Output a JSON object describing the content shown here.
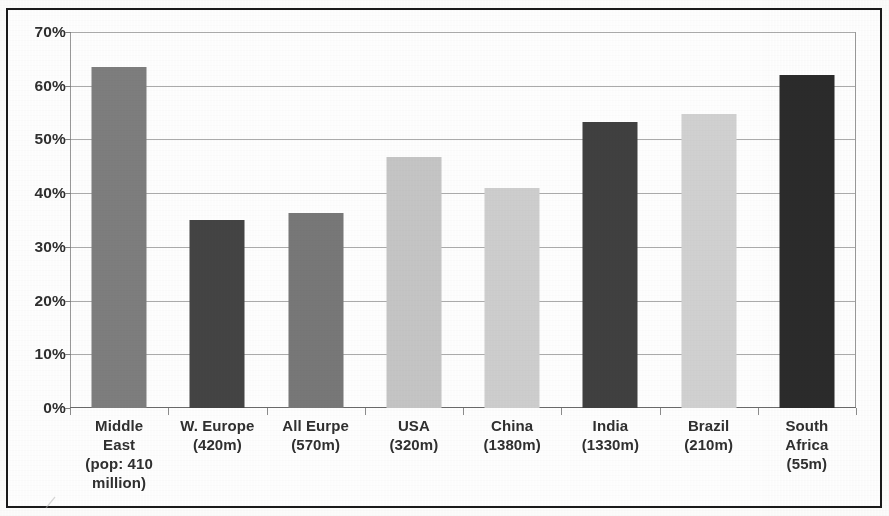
{
  "figure": {
    "frame_color": "#1a1a1a",
    "background": "#ffffff"
  },
  "chart_data": {
    "type": "bar",
    "title": "",
    "subtitle": "",
    "xlabel": "",
    "ylabel": "",
    "ylim": [
      0,
      70
    ],
    "ytick_step": 10,
    "grid": true,
    "legend": "none",
    "value_unit": "%",
    "categories": [
      "Middle East (pop: 410 million)",
      "W. Europe (420m)",
      "All Eurpe (570m)",
      "USA (320m)",
      "China (1380m)",
      "India (1330m)",
      "Brazil (210m)",
      "South Africa (55m)"
    ],
    "values": [
      63.5,
      35.0,
      36.3,
      46.8,
      41.0,
      53.3,
      54.8,
      62.0
    ],
    "bar_colors": [
      "#7e7e7e",
      "#444444",
      "#787878",
      "#c6c6c6",
      "#cfcfcf",
      "#404040",
      "#d2d2d2",
      "#2b2b2b"
    ],
    "ytick_labels": [
      "70%",
      "60%",
      "50%",
      "40%",
      "30%",
      "20%",
      "10%",
      "0%"
    ],
    "ytick_values": [
      70,
      60,
      50,
      40,
      30,
      20,
      10,
      0
    ],
    "xtick_labels": [
      {
        "lines": [
          "Middle",
          "East",
          "(pop: 410",
          "million)"
        ]
      },
      {
        "lines": [
          "W. Europe",
          "(420m)"
        ]
      },
      {
        "lines": [
          "All Eurpe",
          "(570m)"
        ]
      },
      {
        "lines": [
          "USA",
          "(320m)"
        ]
      },
      {
        "lines": [
          "China",
          "(1380m)"
        ]
      },
      {
        "lines": [
          "India",
          "(1330m)"
        ]
      },
      {
        "lines": [
          "Brazil",
          "(210m)"
        ]
      },
      {
        "lines": [
          "South",
          "Africa",
          "(55m)"
        ]
      }
    ]
  }
}
